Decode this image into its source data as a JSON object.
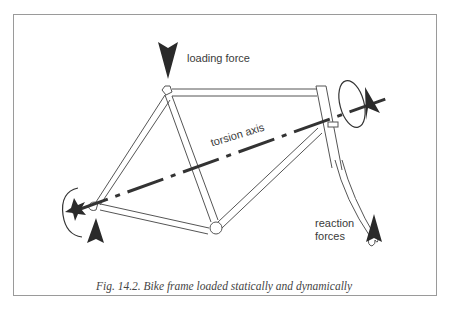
{
  "figure": {
    "labels": {
      "loading_force": "loading force",
      "torsion_axis": "torsion axis",
      "reaction_line1": "reaction",
      "reaction_line2": "forces"
    },
    "caption": "Fig. 14.2. Bike frame  loaded statically and dynamically",
    "colors": {
      "border": "#9a9a9a",
      "tube": "#555555",
      "arrow": "#2a2a2a",
      "axis": "#333333",
      "text": "#3a3a3a"
    }
  }
}
